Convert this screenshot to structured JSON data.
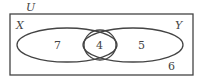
{
  "diagram": {
    "type": "venn",
    "universe_label": "U",
    "sets": [
      {
        "label": "X",
        "only": "7"
      },
      {
        "label": "Y",
        "only": "5"
      }
    ],
    "intersection": "4",
    "outside": "6"
  }
}
